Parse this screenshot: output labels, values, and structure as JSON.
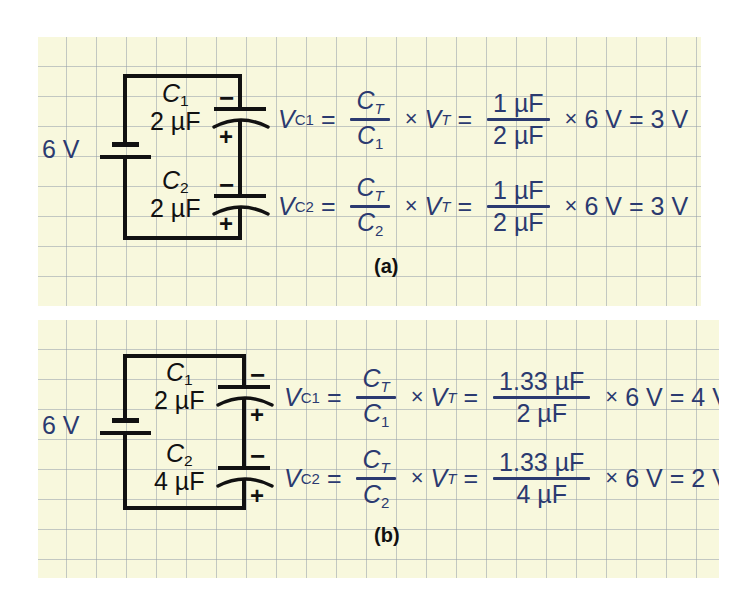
{
  "figure": {
    "type": "capacitive-voltage-divider",
    "panels": [
      {
        "tag": "(a)",
        "source": {
          "label": "6 V",
          "value": 6,
          "unit": "V",
          "symbol": "battery"
        },
        "components": [
          {
            "name": "C",
            "index": "1",
            "value": "2 µF",
            "polarity_top": "−",
            "polarity_bottom": "+"
          },
          {
            "name": "C",
            "index": "2",
            "value": "2 µF",
            "polarity_top": "−",
            "polarity_bottom": "+"
          }
        ],
        "equations": [
          {
            "lhs": "V",
            "lhs_sub": "C1",
            "eq1": "=",
            "frac1_num": "C",
            "frac1_num_sub": "T",
            "frac1_den": "C",
            "frac1_den_sub": "1",
            "times1": "×",
            "vt": "V",
            "vt_sub": "T",
            "eq2": "=",
            "frac2_num": "1 µF",
            "frac2_den": "2 µF",
            "times2": "×",
            "voltage": "6 V",
            "eq3": "=",
            "result": "3 V"
          },
          {
            "lhs": "V",
            "lhs_sub": "C2",
            "eq1": "=",
            "frac1_num": "C",
            "frac1_num_sub": "T",
            "frac1_den": "C",
            "frac1_den_sub": "2",
            "times1": "×",
            "vt": "V",
            "vt_sub": "T",
            "eq2": "=",
            "frac2_num": "1 µF",
            "frac2_den": "2 µF",
            "times2": "×",
            "voltage": "6 V",
            "eq3": "=",
            "result": "3 V"
          }
        ]
      },
      {
        "tag": "(b)",
        "source": {
          "label": "6 V",
          "value": 6,
          "unit": "V",
          "symbol": "battery"
        },
        "components": [
          {
            "name": "C",
            "index": "1",
            "value": "2 µF",
            "polarity_top": "−",
            "polarity_bottom": "+"
          },
          {
            "name": "C",
            "index": "2",
            "value": "4 µF",
            "polarity_top": "−",
            "polarity_bottom": "+"
          }
        ],
        "equations": [
          {
            "lhs": "V",
            "lhs_sub": "C1",
            "eq1": "=",
            "frac1_num": "C",
            "frac1_num_sub": "T",
            "frac1_den": "C",
            "frac1_den_sub": "1",
            "times1": "×",
            "vt": "V",
            "vt_sub": "T",
            "eq2": "=",
            "frac2_num": "1.33 µF",
            "frac2_den": "2 µF",
            "times2": "×",
            "voltage": "6 V",
            "eq3": "=",
            "result": "4 V"
          },
          {
            "lhs": "V",
            "lhs_sub": "C2",
            "eq1": "=",
            "frac1_num": "C",
            "frac1_num_sub": "T",
            "frac1_den": "C",
            "frac1_den_sub": "2",
            "times1": "×",
            "vt": "V",
            "vt_sub": "T",
            "eq2": "=",
            "frac2_num": "1.33 µF",
            "frac2_den": "4 µF",
            "times2": "×",
            "voltage": "6 V",
            "eq3": "=",
            "result": "2 V"
          }
        ]
      }
    ]
  },
  "colors": {
    "paper": "#f8f8dd",
    "grid": "#96a0aa",
    "ink_black": "#111111",
    "ink_blue": "#2b3a70"
  }
}
